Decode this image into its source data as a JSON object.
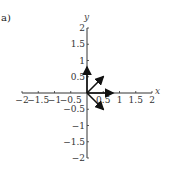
{
  "panel_label": "a)",
  "chart_data": {
    "type": "vector-field",
    "title": "",
    "panel": "a)",
    "xlabel": "x",
    "ylabel": "y",
    "xlim": [
      -2,
      2
    ],
    "ylim": [
      -2,
      2
    ],
    "grid": false,
    "x_ticks": [
      "-2",
      "-1.5",
      "-1",
      "-0.5",
      "0.5",
      "1",
      "1.5",
      "2"
    ],
    "y_ticks": [
      "2",
      "1.5",
      "1",
      "0.5",
      "-0.5",
      "-1",
      "-1.5",
      "-2"
    ],
    "vectors": [
      {
        "from": [
          0,
          0
        ],
        "to": [
          0,
          0.8
        ]
      },
      {
        "from": [
          0,
          0
        ],
        "to": [
          0.8,
          0
        ]
      },
      {
        "from": [
          0,
          0
        ],
        "to": [
          0.5,
          0.5
        ]
      },
      {
        "from": [
          0,
          0
        ],
        "to": [
          0.5,
          -0.5
        ]
      }
    ]
  }
}
